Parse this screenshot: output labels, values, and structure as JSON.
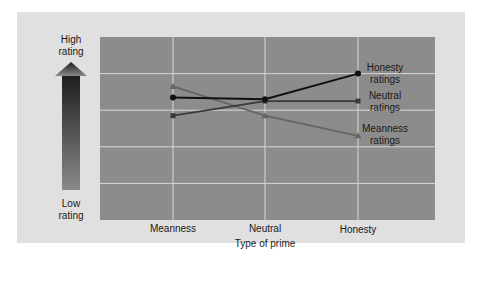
{
  "colors": {
    "page_bg": "#ffffff",
    "panel_bg": "#e0e0e0",
    "plot_bg": "#8c8c8c",
    "grid": "#d8d8d8",
    "honesty_series": "#111111",
    "neutral_series": "#3a3a3a",
    "meanness_series": "#666666"
  },
  "arrow": {
    "top_label_line1": "High",
    "top_label_line2": "rating",
    "bottom_label_line1": "Low",
    "bottom_label_line2": "rating"
  },
  "chart_data": {
    "type": "line",
    "title": "",
    "xlabel": "Type of prime",
    "ylabel": "Rating (Low to High)",
    "categories": [
      "Meanness",
      "Neutral",
      "Honesty"
    ],
    "ylim": [
      0,
      10
    ],
    "yticks_hidden": true,
    "grid": true,
    "legend_position": "inline-right",
    "series": [
      {
        "name": "Honesty ratings",
        "label_line1": "Honesty",
        "label_line2": "ratings",
        "marker": "circle",
        "values": [
          6.7,
          6.6,
          8.0
        ]
      },
      {
        "name": "Neutral ratings",
        "label_line1": "Neutral",
        "label_line2": "ratings",
        "marker": "square",
        "values": [
          5.7,
          6.5,
          6.5
        ]
      },
      {
        "name": "Meanness ratings",
        "label_line1": "Meanness",
        "label_line2": "ratings",
        "marker": "triangle",
        "values": [
          7.3,
          5.7,
          4.6
        ]
      }
    ]
  }
}
